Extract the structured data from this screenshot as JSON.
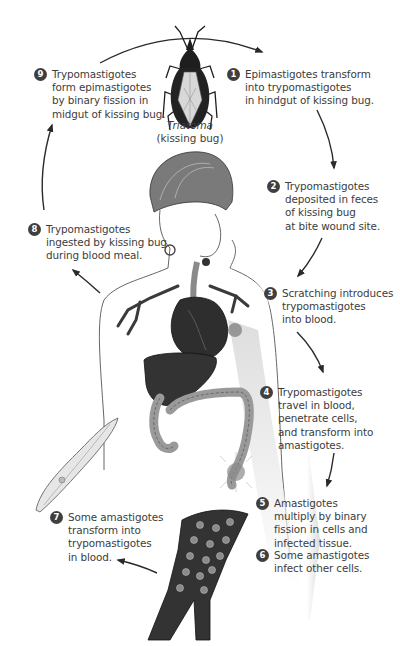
{
  "diagram": {
    "type": "life-cycle",
    "vector_caption": {
      "genus": "Triatoma",
      "common": "(kissing bug)"
    },
    "badge_color": "#3f3f3f",
    "steps": [
      {
        "number": "1",
        "text": "Epimastigotes transform\ninto trypomastigotes\nin hindgut of kissing bug."
      },
      {
        "number": "2",
        "text": "Trypomastigotes\ndeposited in feces\nof kissing bug\nat bite wound site."
      },
      {
        "number": "3",
        "text": "Scratching introduces\ntrypomastigotes\ninto blood."
      },
      {
        "number": "4",
        "text": "Trypomastigotes\ntravel in blood,\npenetrate cells,\nand transform into\namastigotes."
      },
      {
        "number": "5",
        "text": "Amastigotes\nmultiply by binary\nfission in cells and\ninfected tissue."
      },
      {
        "number": "6",
        "text": "Some amastigotes\ninfect other cells."
      },
      {
        "number": "7",
        "text": "Some amastigotes\ntransform into\ntrypomastigotes\nin blood."
      },
      {
        "number": "8",
        "text": "Trypomastigotes\ningested by kissing bug\nduring blood meal."
      },
      {
        "number": "9",
        "text": "Trypomastigotes\nform epimastigotes\nby binary fission in\nmidgut of kissing bug."
      }
    ],
    "illustrations": [
      "kissing-bug",
      "human-figure",
      "heart",
      "liver",
      "colon",
      "trypomastigote",
      "infected-tissue",
      "muscle-fiber-with-amastigotes"
    ]
  }
}
